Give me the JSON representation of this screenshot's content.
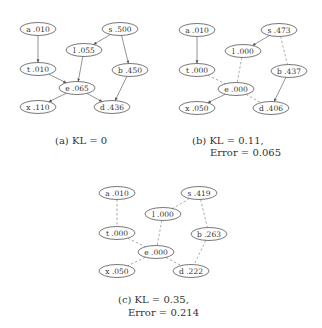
{
  "figure": {
    "nodes_order": [
      "a",
      "s",
      "l",
      "t",
      "b",
      "e",
      "x",
      "d"
    ],
    "panels": [
      {
        "id": "a",
        "caption_lines": [
          "(a) KL = 0"
        ],
        "nodes": {
          "a": "a .010",
          "s": "s .500",
          "l": "l .055",
          "t": "t .010",
          "b": "b .450",
          "e": "e .065",
          "x": "x .110",
          "d": "d .436"
        },
        "edges": [
          {
            "from": "a",
            "to": "t",
            "style": "solid",
            "arrow": true
          },
          {
            "from": "s",
            "to": "l",
            "style": "solid",
            "arrow": true
          },
          {
            "from": "s",
            "to": "b",
            "style": "solid",
            "arrow": true
          },
          {
            "from": "l",
            "to": "e",
            "style": "solid",
            "arrow": true
          },
          {
            "from": "t",
            "to": "e",
            "style": "solid",
            "arrow": true
          },
          {
            "from": "e",
            "to": "x",
            "style": "solid",
            "arrow": true
          },
          {
            "from": "e",
            "to": "d",
            "style": "solid",
            "arrow": true
          },
          {
            "from": "b",
            "to": "d",
            "style": "solid",
            "arrow": true
          }
        ]
      },
      {
        "id": "b",
        "caption_lines": [
          "(b) KL = 0.11,",
          "Error = 0.065"
        ],
        "nodes": {
          "a": "a .010",
          "s": "s .473",
          "l": "l .000",
          "t": "t .000",
          "b": "b .437",
          "e": "e .000",
          "x": "x .050",
          "d": "d .406"
        },
        "edges": [
          {
            "from": "a",
            "to": "t",
            "style": "solid",
            "arrow": true
          },
          {
            "from": "s",
            "to": "l",
            "style": "solid",
            "arrow": true
          },
          {
            "from": "s",
            "to": "b",
            "style": "dashed",
            "arrow": false
          },
          {
            "from": "l",
            "to": "e",
            "style": "dashed",
            "arrow": false
          },
          {
            "from": "t",
            "to": "e",
            "style": "dashed",
            "arrow": false
          },
          {
            "from": "e",
            "to": "x",
            "style": "solid",
            "arrow": true
          },
          {
            "from": "e",
            "to": "d",
            "style": "dashed",
            "arrow": false
          },
          {
            "from": "b",
            "to": "d",
            "style": "solid",
            "arrow": true
          }
        ]
      },
      {
        "id": "c",
        "caption_lines": [
          "(c) KL = 0.35,",
          "Error = 0.214"
        ],
        "nodes": {
          "a": "a .010",
          "s": "s .419",
          "l": "l .000",
          "t": "t .000",
          "b": "b .263",
          "e": "e .000",
          "x": "x .050",
          "d": "d .222"
        },
        "edges": [
          {
            "from": "a",
            "to": "t",
            "style": "dashed",
            "arrow": false
          },
          {
            "from": "s",
            "to": "l",
            "style": "dashed",
            "arrow": false
          },
          {
            "from": "s",
            "to": "b",
            "style": "dashed",
            "arrow": false
          },
          {
            "from": "l",
            "to": "e",
            "style": "dashed",
            "arrow": false
          },
          {
            "from": "t",
            "to": "e",
            "style": "dashed",
            "arrow": false
          },
          {
            "from": "e",
            "to": "x",
            "style": "dashed",
            "arrow": false
          },
          {
            "from": "e",
            "to": "d",
            "style": "dashed",
            "arrow": false
          },
          {
            "from": "b",
            "to": "d",
            "style": "dashed",
            "arrow": false
          }
        ]
      }
    ]
  }
}
